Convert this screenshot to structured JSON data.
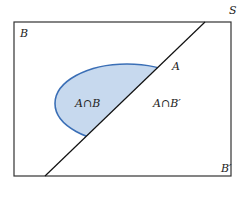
{
  "diagram": {
    "type": "venn",
    "sample_space_label": "S",
    "event_b_label": "B",
    "event_a_label": "A",
    "complement_b_label": "B′",
    "regions": [
      {
        "label": "A∩B",
        "fill": "#c7d9ee"
      },
      {
        "label": "A∩B′",
        "fill": "#c5c7b8"
      }
    ],
    "colors": {
      "ellipse_left_stroke": "#3b6fb6",
      "ellipse_right_stroke": "#e0cf62",
      "divider_line": "#111111",
      "frame": "#333333"
    }
  }
}
